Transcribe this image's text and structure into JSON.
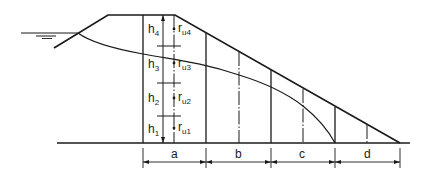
{
  "diagram": {
    "type": "embankment dam cross-section with phreatic line and pore pressure ratio zones",
    "colors": {
      "line": "#1a1a1a",
      "background": "#ffffff"
    },
    "upstream_water_symbol": "water-level-icon",
    "height_labels": [
      {
        "main": "h",
        "sub": "4"
      },
      {
        "main": "h",
        "sub": "3"
      },
      {
        "main": "h",
        "sub": "2"
      },
      {
        "main": "h",
        "sub": "1"
      }
    ],
    "ru_labels": [
      {
        "main": "r",
        "sub": "u4"
      },
      {
        "main": "r",
        "sub": "u3"
      },
      {
        "main": "r",
        "sub": "u2"
      },
      {
        "main": "r",
        "sub": "u1"
      }
    ],
    "zones": [
      {
        "label": "a"
      },
      {
        "label": "b"
      },
      {
        "label": "c"
      },
      {
        "label": "d"
      }
    ]
  }
}
